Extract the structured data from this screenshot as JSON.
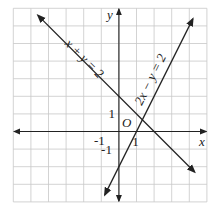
{
  "chart_data": {
    "type": "line",
    "title": "",
    "xlabel": "x",
    "ylabel": "y",
    "xlim": [
      -6,
      5
    ],
    "ylim": [
      -4,
      7
    ],
    "grid": true,
    "origin_label": "O",
    "tick_labels": {
      "x": [
        {
          "value": -1,
          "label": "-1"
        },
        {
          "value": 1,
          "label": "1"
        }
      ],
      "y": [
        {
          "value": 1,
          "label": "1"
        },
        {
          "value": -1,
          "label": "-1"
        }
      ]
    },
    "series": [
      {
        "name": "x + y = 2",
        "label": "x + y = 2",
        "slope": -1,
        "intercept": 2,
        "x_range": [
          -4.6,
          4.3
        ]
      },
      {
        "name": "2x − y = 2",
        "label": "2x − y = 2",
        "slope": 2,
        "intercept": -2,
        "x_range": [
          -0.8,
          4.2
        ]
      }
    ],
    "intersection": {
      "x": 1.333,
      "y": 0.667
    }
  }
}
